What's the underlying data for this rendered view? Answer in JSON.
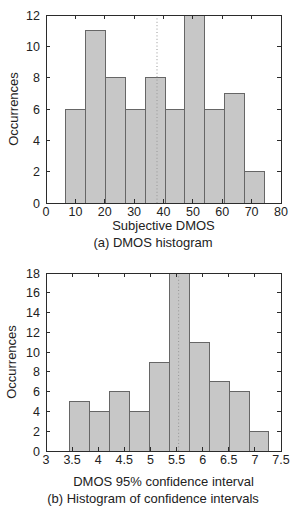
{
  "styles": {
    "bar_fill": "#c7c7c7",
    "bar_stroke": "#666666",
    "axis_color": "#2b2b2b",
    "marker_color": "#969696",
    "text_color": "#222222",
    "background": "#ffffff"
  },
  "chart_data": [
    {
      "type": "bar",
      "variant": "histogram",
      "caption": "(a) DMOS histogram",
      "xlabel": "Subjective DMOS",
      "ylabel": "Occurrences",
      "bin_edges": [
        6.5,
        13.3,
        20.1,
        26.9,
        33.7,
        40.5,
        47.3,
        54.1,
        60.9,
        67.7,
        74.5
      ],
      "values": [
        6,
        11,
        8,
        6,
        8,
        6,
        12,
        6,
        7,
        2
      ],
      "xlim": [
        0,
        80
      ],
      "ylim": [
        0,
        12
      ],
      "xticks": [
        0,
        10,
        20,
        30,
        40,
        50,
        60,
        70,
        80
      ],
      "xtick_labels": [
        "0",
        "10",
        "20",
        "30",
        "40",
        "50",
        "60",
        "70",
        "80"
      ],
      "yticks": [
        0,
        2,
        4,
        6,
        8,
        10,
        12
      ],
      "ytick_labels": [
        "0",
        "2",
        "4",
        "6",
        "8",
        "10",
        "12"
      ],
      "marker_line_x": 37.8,
      "grid": false,
      "legend": null
    },
    {
      "type": "bar",
      "variant": "histogram",
      "caption": "(b) Histogram of confidence intervals",
      "xlabel": "DMOS 95% confidence interval",
      "ylabel": "Occurrences",
      "bin_edges": [
        3.45,
        3.83,
        4.21,
        4.6,
        4.98,
        5.36,
        5.74,
        6.13,
        6.51,
        6.89,
        7.27
      ],
      "values": [
        5,
        4,
        6,
        4,
        9,
        18,
        11,
        7,
        6,
        2
      ],
      "xlim": [
        3,
        7.5
      ],
      "ylim": [
        0,
        18
      ],
      "xticks": [
        3,
        3.5,
        4,
        4.5,
        5,
        5.5,
        6,
        6.5,
        7,
        7.5
      ],
      "xtick_labels": [
        "3",
        "3.5",
        "4",
        "4.5",
        "5",
        "5.5",
        "6",
        "6.5",
        "7",
        "7.5"
      ],
      "yticks": [
        0,
        2,
        4,
        6,
        8,
        10,
        12,
        14,
        16,
        18
      ],
      "ytick_labels": [
        "0",
        "2",
        "4",
        "6",
        "8",
        "10",
        "12",
        "14",
        "16",
        "18"
      ],
      "marker_line_x": 5.54,
      "grid": false,
      "legend": null
    }
  ]
}
